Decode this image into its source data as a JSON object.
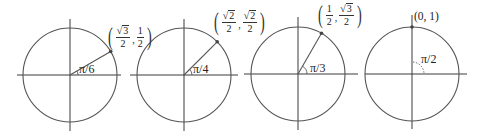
{
  "figure": {
    "stroke_color": "#555555",
    "panels": [
      {
        "id": "pi-over-6",
        "angle_label": "π/6",
        "center": [
          70,
          75
        ],
        "radius": 47,
        "angle_deg": 30,
        "axis_h": [
          17,
          121
        ],
        "axis_v": [
          19,
          131
        ],
        "point": {
          "x_num_sqrt": "3",
          "x_num": "",
          "x_den": "2",
          "y_num": "1",
          "y_den": "2",
          "text": "(√3/2, 1/2)"
        }
      },
      {
        "id": "pi-over-4",
        "angle_label": "π/4",
        "center": [
          184,
          75
        ],
        "radius": 47,
        "angle_deg": 45,
        "axis_h": [
          130,
          238
        ],
        "axis_v": [
          19,
          131
        ],
        "point": {
          "x_num_sqrt": "2",
          "x_den": "2",
          "y_num_sqrt": "2",
          "y_den": "2",
          "text": "(√2/2, √2/2)"
        }
      },
      {
        "id": "pi-over-3",
        "angle_label": "π/3",
        "center": [
          298,
          74
        ],
        "radius": 47,
        "angle_deg": 60,
        "axis_h": [
          244,
          358
        ],
        "axis_v": [
          17,
          130
        ],
        "point": {
          "x_num": "1",
          "x_den": "2",
          "y_num_sqrt": "3",
          "y_den": "2",
          "text": "(1/2, √3/2)"
        }
      },
      {
        "id": "pi-over-2",
        "angle_label": "π/2",
        "center": [
          412,
          74
        ],
        "radius": 47,
        "angle_deg": 90,
        "axis_h": [
          365,
          467
        ],
        "axis_v": [
          15,
          129
        ],
        "point": {
          "text": "(0, 1)"
        }
      }
    ]
  }
}
